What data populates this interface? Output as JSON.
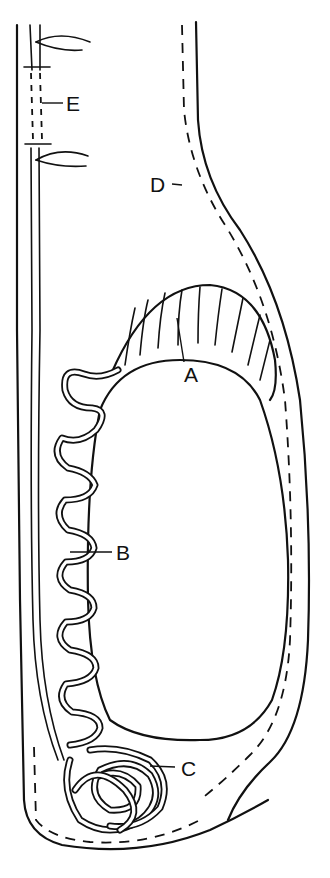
{
  "diagram": {
    "type": "anatomical line drawing",
    "labels": [
      {
        "id": "A",
        "text": "A",
        "x": 184,
        "y": 382,
        "points_to": "radial tubules at top of cavity"
      },
      {
        "id": "B",
        "text": "B",
        "x": 142,
        "y": 558,
        "points_to": "convoluted duct along left side"
      },
      {
        "id": "C",
        "text": "C",
        "x": 181,
        "y": 776,
        "points_to": "coiled tubular mass at base"
      },
      {
        "id": "D",
        "text": "D",
        "x": 163,
        "y": 189,
        "points_to": "dashed outer layer on right"
      },
      {
        "id": "E",
        "text": "E",
        "x": 66,
        "y": 104,
        "points_to": "dashed segment of left channel"
      }
    ],
    "colors": {
      "ink": "#111111",
      "background": "#ffffff"
    }
  }
}
